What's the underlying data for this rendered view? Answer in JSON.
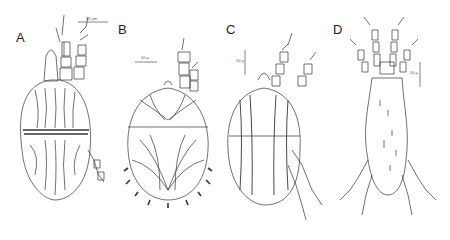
{
  "figure": {
    "panels": [
      {
        "label": "A",
        "scale_bar": "50 µm",
        "description": "dorsal view, ovoid idiosoma with striated cuticle and transverse furrow"
      },
      {
        "label": "B",
        "scale_bar": "50 µ",
        "description": "dorsal view, rounded body with radiating striations and marginal setae"
      },
      {
        "label": "C",
        "scale_bar": "50 µ",
        "description": "dorsal view, oval body with two striated longitudinal bands"
      },
      {
        "label": "D",
        "scale_bar": "50 µ",
        "description": "dorsal view, elongate body with sparse setae and long legs"
      }
    ],
    "colors": {
      "ink": "#333333",
      "background": "#ffffff"
    }
  }
}
